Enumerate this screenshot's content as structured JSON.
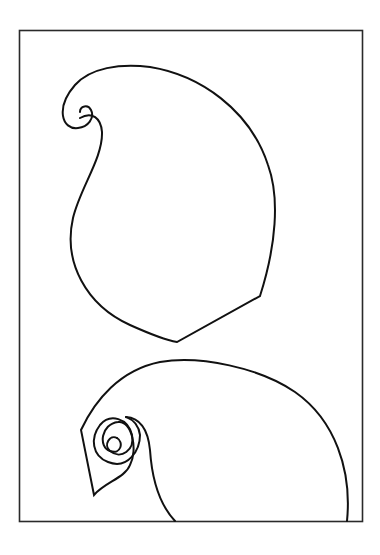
{
  "page": {
    "background": "#ffffff",
    "line_color": "#111111"
  },
  "shapes": [
    {
      "name": "paisley-large",
      "position": "top"
    },
    {
      "name": "paisley-partial",
      "position": "bottom"
    }
  ]
}
